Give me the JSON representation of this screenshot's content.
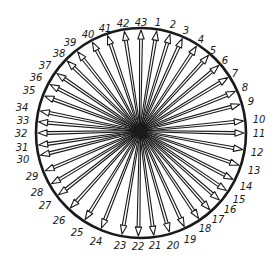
{
  "diagram": {
    "type": "radial-arrow-circle",
    "stroke_color": "#1a1a1a",
    "background_color": "#ffffff",
    "circle": {
      "cx": 141,
      "cy": 133,
      "r": 105
    },
    "center": {
      "x": 140,
      "y": 131
    },
    "point_count": 43,
    "points": [
      {
        "label": "1",
        "lx": 158,
        "ly": 22
      },
      {
        "label": "2",
        "lx": 173,
        "ly": 24
      },
      {
        "label": "3",
        "lx": 186,
        "ly": 30
      },
      {
        "label": "4",
        "lx": 201,
        "ly": 39
      },
      {
        "label": "5",
        "lx": 213,
        "ly": 50
      },
      {
        "label": "6",
        "lx": 225,
        "ly": 60
      },
      {
        "label": "7",
        "lx": 235,
        "ly": 73
      },
      {
        "label": "8",
        "lx": 245,
        "ly": 87
      },
      {
        "label": "9",
        "lx": 251,
        "ly": 101
      },
      {
        "label": "10",
        "lx": 259,
        "ly": 119
      },
      {
        "label": "11",
        "lx": 259,
        "ly": 133
      },
      {
        "label": "12",
        "lx": 257,
        "ly": 152
      },
      {
        "label": "13",
        "lx": 254,
        "ly": 170
      },
      {
        "label": "14",
        "lx": 246,
        "ly": 186
      },
      {
        "label": "15",
        "lx": 239,
        "ly": 199
      },
      {
        "label": "16",
        "lx": 230,
        "ly": 209
      },
      {
        "label": "17",
        "lx": 218,
        "ly": 219
      },
      {
        "label": "18",
        "lx": 205,
        "ly": 228
      },
      {
        "label": "19",
        "lx": 190,
        "ly": 239
      },
      {
        "label": "20",
        "lx": 173,
        "ly": 245
      },
      {
        "label": "21",
        "lx": 155,
        "ly": 245
      },
      {
        "label": "22",
        "lx": 138,
        "ly": 246
      },
      {
        "label": "23",
        "lx": 120,
        "ly": 245
      },
      {
        "label": "24",
        "lx": 96,
        "ly": 241
      },
      {
        "label": "25",
        "lx": 77,
        "ly": 232
      },
      {
        "label": "26",
        "lx": 59,
        "ly": 220
      },
      {
        "label": "27",
        "lx": 45,
        "ly": 205
      },
      {
        "label": "28",
        "lx": 37,
        "ly": 192
      },
      {
        "label": "29",
        "lx": 32,
        "ly": 176
      },
      {
        "label": "30",
        "lx": 23,
        "ly": 159
      },
      {
        "label": "31",
        "lx": 22,
        "ly": 147
      },
      {
        "label": "32",
        "lx": 21,
        "ly": 133
      },
      {
        "label": "33",
        "lx": 23,
        "ly": 120
      },
      {
        "label": "34",
        "lx": 22,
        "ly": 107
      },
      {
        "label": "35",
        "lx": 29,
        "ly": 90
      },
      {
        "label": "36",
        "lx": 36,
        "ly": 77
      },
      {
        "label": "37",
        "lx": 45,
        "ly": 65
      },
      {
        "label": "38",
        "lx": 59,
        "ly": 53
      },
      {
        "label": "39",
        "lx": 70,
        "ly": 42
      },
      {
        "label": "40",
        "lx": 88,
        "ly": 34
      },
      {
        "label": "41",
        "lx": 105,
        "ly": 28
      },
      {
        "label": "42",
        "lx": 123,
        "ly": 23
      },
      {
        "label": "43",
        "lx": 141,
        "ly": 22
      }
    ]
  }
}
